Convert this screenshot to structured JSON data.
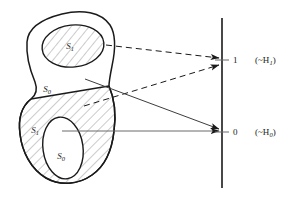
{
  "figure": {
    "name": "decision-regions-mapping-diagram",
    "stroke_color": "#1a1a1a",
    "hatch_color": "#8c8c8c",
    "arrow_color": "#4d4d4d",
    "background": "#ffffff"
  },
  "sample_space": {
    "label": "sample-space-blob",
    "regions": [
      {
        "id": "upper-inner-ellipse",
        "label": "S",
        "subscript": "1",
        "fill": "hatched",
        "x": 72,
        "y": 46
      },
      {
        "id": "upper-outer-area",
        "label": "S",
        "subscript": "0",
        "fill": "white",
        "x": 49,
        "y": 89
      },
      {
        "id": "lower-outer-area",
        "label": "S",
        "subscript": "1",
        "fill": "hatched",
        "x": 36,
        "y": 130
      },
      {
        "id": "lower-inner-ellipse",
        "label": "S",
        "subscript": "0",
        "fill": "white",
        "x": 62,
        "y": 156
      }
    ]
  },
  "axis": {
    "name": "decision-axis",
    "x": 222,
    "top": 18,
    "bottom": 188,
    "ticks": [
      {
        "id": "tick-one",
        "value": "1",
        "tag": "(~H",
        "tag_sub": "1",
        "tag_end": ")",
        "y": 60,
        "num_x": 233,
        "tag_x": 255
      },
      {
        "id": "tick-zero",
        "value": "0",
        "tag": "(~H",
        "tag_sub": "0",
        "tag_end": ")",
        "y": 132,
        "num_x": 233,
        "tag_x": 255
      }
    ]
  },
  "arrows": [
    {
      "id": "arrow-upper-s1-to-one",
      "style": "dashed",
      "x1": 106,
      "y1": 45,
      "x2": 220,
      "y2": 58
    },
    {
      "id": "arrow-lower-s1-to-one",
      "style": "dashed",
      "x1": 84,
      "y1": 106,
      "x2": 220,
      "y2": 64
    },
    {
      "id": "arrow-upper-s0-to-zero",
      "style": "solid",
      "x1": 85,
      "y1": 79,
      "x2": 220,
      "y2": 130
    },
    {
      "id": "arrow-lower-s0-to-zero",
      "style": "solid",
      "x1": 62,
      "y1": 131,
      "x2": 220,
      "y2": 131
    }
  ]
}
